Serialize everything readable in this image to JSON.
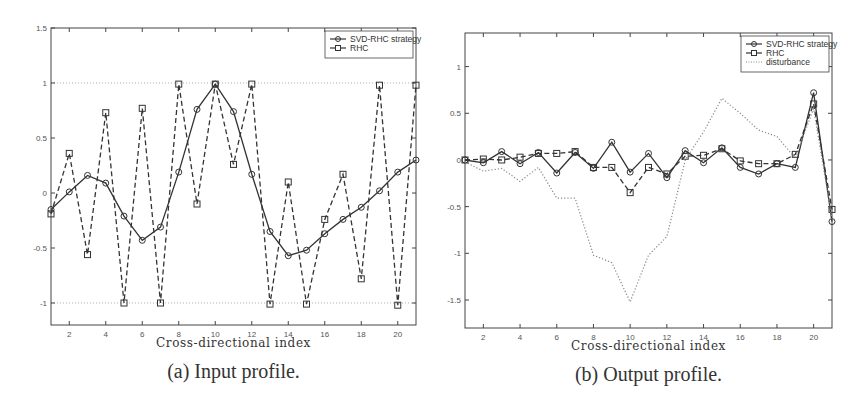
{
  "chart_data": [
    {
      "type": "line",
      "caption": "(a) Input profile.",
      "xlabel": "Cross-directional index",
      "ylabel": "",
      "xlim": [
        1,
        21
      ],
      "ylim": [
        -1.2,
        1.5
      ],
      "xticks": [
        2,
        4,
        6,
        8,
        10,
        12,
        14,
        16,
        18,
        20
      ],
      "yticks": [
        1.5,
        1,
        0.5,
        0,
        -0.5,
        -1
      ],
      "ytick_labels": [
        "1.5",
        "1",
        "0.5",
        "0",
        "-0.5",
        "-1"
      ],
      "reference_lines": [
        1,
        -1
      ],
      "grid": false,
      "legend_position": "upper right",
      "x": [
        1,
        2,
        3,
        4,
        5,
        6,
        7,
        8,
        9,
        10,
        11,
        12,
        13,
        14,
        15,
        16,
        17,
        18,
        19,
        20,
        21
      ],
      "series": [
        {
          "name": "SVD-RHC strategy",
          "style": "solid-circle",
          "values": [
            -0.15,
            0.01,
            0.16,
            0.09,
            -0.21,
            -0.43,
            -0.31,
            0.19,
            0.76,
            0.99,
            0.74,
            0.17,
            -0.35,
            -0.57,
            -0.52,
            -0.37,
            -0.24,
            -0.13,
            0.02,
            0.19,
            0.3
          ]
        },
        {
          "name": "RHC",
          "style": "dashed-square",
          "values": [
            -0.19,
            0.36,
            -0.56,
            0.73,
            -1.0,
            0.77,
            -1.0,
            0.99,
            -0.1,
            0.99,
            0.26,
            0.99,
            -1.01,
            0.1,
            -1.01,
            -0.24,
            0.17,
            -0.78,
            0.98,
            -1.02,
            0.98
          ]
        }
      ]
    },
    {
      "type": "line",
      "caption": "(b) Output profile.",
      "xlabel": "Cross-directional index",
      "ylabel": "",
      "xlim": [
        1,
        21
      ],
      "ylim": [
        -1.8,
        1.36
      ],
      "xticks": [
        2,
        4,
        6,
        8,
        10,
        12,
        14,
        16,
        18,
        20
      ],
      "yticks": [
        1,
        0.5,
        0,
        -0.5,
        -1,
        -1.5
      ],
      "ytick_labels": [
        "1",
        "0.5",
        "0",
        "-0.5",
        "-1",
        "-1.5"
      ],
      "grid": false,
      "legend_position": "upper right",
      "x": [
        1,
        2,
        3,
        4,
        5,
        6,
        7,
        8,
        9,
        10,
        11,
        12,
        13,
        14,
        15,
        16,
        17,
        18,
        19,
        20,
        21
      ],
      "series": [
        {
          "name": "SVD-RHC strategy",
          "style": "solid-circle",
          "values": [
            0.0,
            -0.03,
            0.09,
            -0.04,
            0.08,
            -0.14,
            0.08,
            -0.09,
            0.19,
            -0.13,
            0.07,
            -0.19,
            0.1,
            -0.03,
            0.13,
            -0.08,
            -0.15,
            -0.04,
            -0.08,
            0.72,
            -0.66
          ]
        },
        {
          "name": "RHC",
          "style": "dashed-square",
          "values": [
            0.0,
            0.01,
            0.0,
            0.03,
            0.07,
            0.07,
            0.09,
            -0.08,
            -0.08,
            -0.35,
            -0.08,
            -0.15,
            0.04,
            0.05,
            0.12,
            -0.01,
            -0.04,
            -0.04,
            0.06,
            0.6,
            -0.53
          ]
        },
        {
          "name": "disturbance",
          "style": "dotted",
          "values": [
            -0.02,
            -0.12,
            -0.09,
            -0.23,
            -0.08,
            -0.41,
            -0.41,
            -1.02,
            -1.1,
            -1.52,
            -1.02,
            -0.82,
            0.0,
            0.3,
            0.66,
            0.5,
            0.32,
            0.25,
            0.02,
            0.55,
            -0.63
          ]
        }
      ]
    }
  ],
  "layout": [
    {
      "box": [
        51,
        28,
        416,
        325
      ]
    },
    {
      "box": [
        465,
        33,
        832,
        328
      ]
    }
  ],
  "colors": {
    "line": "#333333",
    "axis": "#444444",
    "disturbance": "#888888",
    "refline": "#999999"
  }
}
